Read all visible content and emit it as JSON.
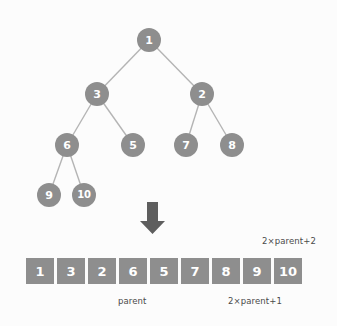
{
  "diagram": {
    "colors": {
      "node_fill": "#8e8e8e",
      "node_text": "#ffffff",
      "edge": "#b4b4b4",
      "arrow": "#5e5e5e",
      "cell_fill": "#8e8e8e",
      "cell_text": "#ffffff",
      "caption_text": "#4a4a4a",
      "background": "#fcfcfc"
    },
    "tree": {
      "nodes": [
        {
          "id": "n1",
          "label": "1",
          "cx": 149,
          "cy": 40,
          "r": 12
        },
        {
          "id": "n3",
          "label": "3",
          "cx": 97,
          "cy": 94,
          "r": 12
        },
        {
          "id": "n2",
          "label": "2",
          "cx": 202,
          "cy": 94,
          "r": 12
        },
        {
          "id": "n6",
          "label": "6",
          "cx": 67,
          "cy": 145,
          "r": 12
        },
        {
          "id": "n5",
          "label": "5",
          "cx": 133,
          "cy": 145,
          "r": 12
        },
        {
          "id": "n7",
          "label": "7",
          "cx": 186,
          "cy": 145,
          "r": 12
        },
        {
          "id": "n8",
          "label": "8",
          "cx": 232,
          "cy": 145,
          "r": 12
        },
        {
          "id": "n9",
          "label": "9",
          "cx": 49,
          "cy": 195,
          "r": 12
        },
        {
          "id": "n10",
          "label": "10",
          "cx": 84,
          "cy": 195,
          "r": 12
        }
      ],
      "edges": [
        {
          "from": "n1",
          "to": "n3"
        },
        {
          "from": "n1",
          "to": "n2"
        },
        {
          "from": "n3",
          "to": "n6"
        },
        {
          "from": "n3",
          "to": "n5"
        },
        {
          "from": "n2",
          "to": "n7"
        },
        {
          "from": "n2",
          "to": "n8"
        },
        {
          "from": "n6",
          "to": "n9"
        },
        {
          "from": "n6",
          "to": "n10"
        }
      ]
    },
    "arrow": {
      "direction": "down",
      "x": 139,
      "y": 202,
      "width": 27,
      "height": 33
    },
    "array": {
      "values": [
        "1",
        "3",
        "2",
        "6",
        "5",
        "7",
        "8",
        "9",
        "10"
      ]
    },
    "captions": {
      "top_right": "2×parent+2",
      "parent": "parent",
      "left_child": "2×parent+1"
    }
  }
}
